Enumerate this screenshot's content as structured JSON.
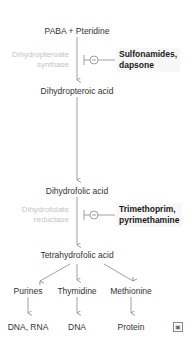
{
  "diagram": {
    "nodes": {
      "paba": "PABA + Pteridine",
      "dihydropteroic": "Dihydropteroic acid",
      "dihydrofolic": "Dihydrofolic acid",
      "tetrahydrofolic": "Tetrahydrofolic acid",
      "purines": "Purines",
      "thymidine": "Thymidine",
      "methionine": "Methionine",
      "dna_rna": "DNA, RNA",
      "dna": "DNA",
      "protein": "Protein"
    },
    "enzymes": {
      "e1_line1": "Dihydropteroate",
      "e1_line2": "synthase",
      "e2_line1": "Dihydrofolate",
      "e2_line2": "reductase"
    },
    "inhibitors": {
      "d1_line1": "Sulfonamides,",
      "d1_line2": "dapsone",
      "d2_line1": "Trimethoprim,",
      "d2_line2": "pyrimethamine"
    },
    "inhibitor_symbol": "−",
    "corner_icon": "image-icon",
    "colors": {
      "text": "#333333",
      "enzyme_text": "#c4c4c4",
      "lines": "#888888",
      "drug_text": "#1a1a1a"
    }
  }
}
